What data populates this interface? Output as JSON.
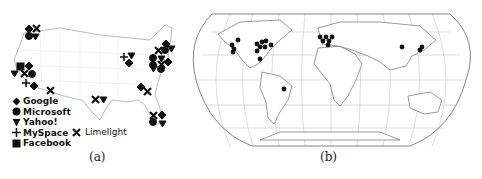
{
  "figure": {
    "panel_a": {
      "caption": "(a)",
      "map": "United States",
      "legend": [
        {
          "label": "Google",
          "symbol": "diamond"
        },
        {
          "label": "Microsoft",
          "symbol": "circle"
        },
        {
          "label": "Yahoo!",
          "symbol": "triangle-down"
        },
        {
          "label": "MySpace",
          "symbol": "plus"
        },
        {
          "label": "Facebook",
          "symbol": "square"
        },
        {
          "label": "Limelight",
          "symbol": "x"
        }
      ]
    },
    "panel_b": {
      "caption": "(b)",
      "map": "World",
      "marker": "circle"
    }
  }
}
